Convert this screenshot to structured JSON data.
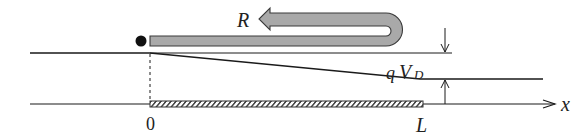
{
  "diagram": {
    "labels": {
      "R": "R",
      "q": "q",
      "V": "V",
      "D_subscript": "D",
      "x_axis": "x",
      "origin": "0",
      "length": "L"
    },
    "colors": {
      "line": "#1a1a1a",
      "bar_fill": "#a9a9a9",
      "bar_stroke": "#3a3a3a",
      "hatch": "#333333"
    }
  }
}
